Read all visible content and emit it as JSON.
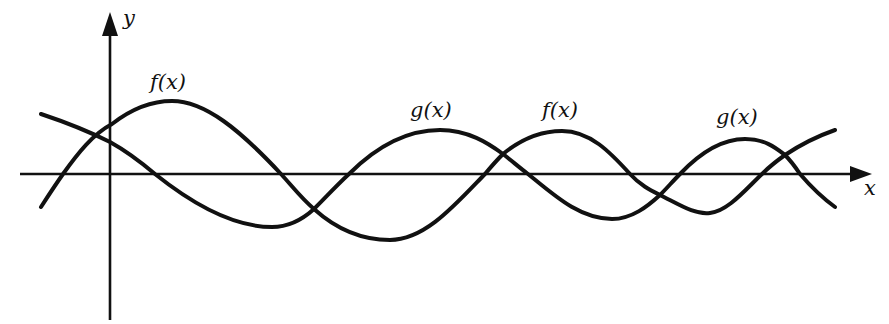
{
  "diagram": {
    "type": "function-graph",
    "colors": {
      "ink": "#111111",
      "background": "#ffffff"
    },
    "axes": {
      "x_label": "x",
      "y_label": "y"
    },
    "labels": [
      {
        "id": "f1",
        "text": "f(x)",
        "curve": "f",
        "x": 150,
        "y": 75
      },
      {
        "id": "g1",
        "text": "g(x)",
        "curve": "g",
        "x": 410,
        "y": 102
      },
      {
        "id": "f2",
        "text": "f(x)",
        "curve": "f",
        "x": 542,
        "y": 102
      },
      {
        "id": "g2",
        "text": "g(x)",
        "curve": "g",
        "x": 716,
        "y": 109
      }
    ],
    "curves": [
      {
        "name": "f",
        "description": "wave starting below x-axis on left, first peak near y-axis right side, amplitude decreasing, crossing axis at ~63, 281, 485, 630, 762 px"
      },
      {
        "name": "g",
        "description": "wave starting above x-axis on left, decreasing through y-axis, crossing axis at ~155, 349, 528, 680, 800 px"
      }
    ]
  }
}
